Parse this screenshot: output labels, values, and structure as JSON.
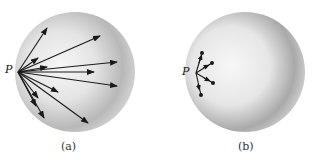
{
  "figure": {
    "panels": [
      {
        "id": "a",
        "caption": "(a)",
        "point_label": "P",
        "description": "Sphere with many long arrows radiating from point P on its surface into the interior"
      },
      {
        "id": "b",
        "caption": "(b)",
        "point_label": "P",
        "description": "Sphere with a few short vectors ending in dots near point P on its surface"
      }
    ],
    "colors": {
      "sphere_light": "#f4f4f4",
      "sphere_dark": "#9a9a9a",
      "arrow": "#1a1a1a"
    }
  }
}
